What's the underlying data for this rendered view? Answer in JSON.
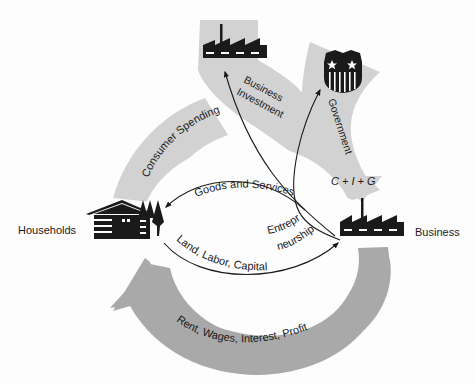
{
  "diagram": {
    "title": "",
    "nodes": {
      "households": {
        "label": "Households",
        "icon": "house-with-trees-icon"
      },
      "business": {
        "label": "Business",
        "icon": "factory-icon"
      },
      "business_investment_sink": {
        "icon": "factory-icon"
      },
      "government": {
        "icon": "shield-with-stars-icon"
      }
    },
    "flows": {
      "consumer_spending": "Consumer Spending",
      "business_investment_line1": "Business",
      "business_investment_line2": "Investment",
      "government": "Government",
      "total": "C + I + G",
      "goods_and_services": "Goods and Services",
      "land_labor_capital": "Land, Labor, Capital",
      "entrepreneurship_line1": "Entrepre–",
      "entrepreneurship_line2": "neurship",
      "factor_income": "Rent, Wages, Interest, Profit"
    },
    "colors": {
      "light_flow": "#d2d2d2",
      "dark_flow": "#a9a9a9",
      "ink": "#1a1a1a",
      "background": "#fdfdfd"
    }
  }
}
